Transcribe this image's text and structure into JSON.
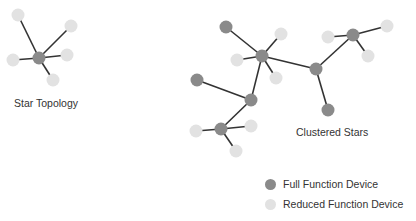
{
  "labels": {
    "star": "Star Topology",
    "clustered": "Clustered Stars"
  },
  "legend": [
    {
      "label": "Full Function Device",
      "color": "#8a8a8a"
    },
    {
      "label": "Reduced Function Device",
      "color": "#e2e2e2"
    }
  ],
  "colors": {
    "ffd": "#8a8a8a",
    "rfd": "#e2e2e2",
    "edge": "#333333"
  },
  "nodes": [
    {
      "id": "s0",
      "x": 39,
      "y": 58,
      "type": "ffd"
    },
    {
      "id": "s1",
      "x": 18,
      "y": 15,
      "type": "rfd"
    },
    {
      "id": "s2",
      "x": 71,
      "y": 26,
      "type": "rfd"
    },
    {
      "id": "s3",
      "x": 67,
      "y": 55,
      "type": "rfd"
    },
    {
      "id": "s4",
      "x": 13,
      "y": 60,
      "type": "rfd"
    },
    {
      "id": "s5",
      "x": 53,
      "y": 80,
      "type": "rfd"
    },
    {
      "id": "a",
      "x": 262,
      "y": 56,
      "type": "ffd"
    },
    {
      "id": "a1",
      "x": 226,
      "y": 27,
      "type": "ffd"
    },
    {
      "id": "a2",
      "x": 281,
      "y": 34,
      "type": "rfd"
    },
    {
      "id": "a3",
      "x": 237,
      "y": 60,
      "type": "rfd"
    },
    {
      "id": "a4",
      "x": 276,
      "y": 78,
      "type": "rfd"
    },
    {
      "id": "b",
      "x": 316,
      "y": 69,
      "type": "ffd"
    },
    {
      "id": "b1",
      "x": 328,
      "y": 110,
      "type": "ffd"
    },
    {
      "id": "c",
      "x": 353,
      "y": 35,
      "type": "ffd"
    },
    {
      "id": "c1",
      "x": 328,
      "y": 37,
      "type": "rfd"
    },
    {
      "id": "c2",
      "x": 387,
      "y": 26,
      "type": "rfd"
    },
    {
      "id": "c3",
      "x": 368,
      "y": 56,
      "type": "rfd"
    },
    {
      "id": "d",
      "x": 251,
      "y": 100,
      "type": "ffd"
    },
    {
      "id": "d1",
      "x": 197,
      "y": 80,
      "type": "ffd"
    },
    {
      "id": "e",
      "x": 221,
      "y": 129,
      "type": "ffd"
    },
    {
      "id": "e1",
      "x": 196,
      "y": 131,
      "type": "rfd"
    },
    {
      "id": "e2",
      "x": 251,
      "y": 126,
      "type": "rfd"
    },
    {
      "id": "e3",
      "x": 236,
      "y": 151,
      "type": "rfd"
    }
  ],
  "edges": [
    [
      "s0",
      "s1"
    ],
    [
      "s0",
      "s2"
    ],
    [
      "s0",
      "s3"
    ],
    [
      "s0",
      "s4"
    ],
    [
      "s0",
      "s5"
    ],
    [
      "a",
      "a1"
    ],
    [
      "a",
      "a2"
    ],
    [
      "a",
      "a3"
    ],
    [
      "a",
      "a4"
    ],
    [
      "a",
      "b"
    ],
    [
      "a",
      "d"
    ],
    [
      "b",
      "b1"
    ],
    [
      "b",
      "c"
    ],
    [
      "c",
      "c1"
    ],
    [
      "c",
      "c2"
    ],
    [
      "c",
      "c3"
    ],
    [
      "d",
      "d1"
    ],
    [
      "d",
      "e"
    ],
    [
      "e",
      "e1"
    ],
    [
      "e",
      "e2"
    ],
    [
      "e",
      "e3"
    ]
  ]
}
